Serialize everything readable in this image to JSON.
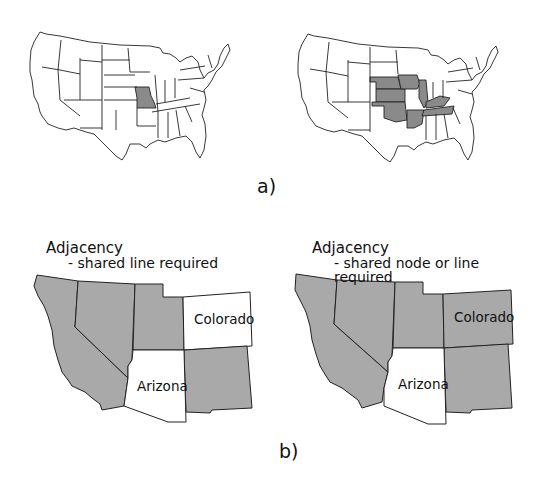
{
  "colors": {
    "shaded": "#a9a9a9",
    "dark_shaded": "#8a8a8a",
    "unshaded": "#ffffff",
    "outline": "#222222"
  },
  "figure_a": {
    "caption": "a)",
    "left_map": {
      "highlighted_states": [
        "Missouri"
      ]
    },
    "right_map": {
      "highlighted_states": [
        "Iowa",
        "Illinois",
        "Kentucky",
        "Tennessee",
        "Arkansas",
        "Oklahoma",
        "Kansas",
        "Nebraska"
      ],
      "center_state_unshaded": "Missouri"
    }
  },
  "figure_b": {
    "caption": "b)",
    "left_panel": {
      "title": "Adjacency",
      "subtitle": "- shared line required",
      "labels": {
        "colorado": "Colorado",
        "arizona": "Arizona"
      }
    },
    "right_panel": {
      "title": "Adjacency",
      "subtitle": "- shared node or line required",
      "labels": {
        "colorado": "Colorado",
        "arizona": "Arizona"
      }
    }
  }
}
